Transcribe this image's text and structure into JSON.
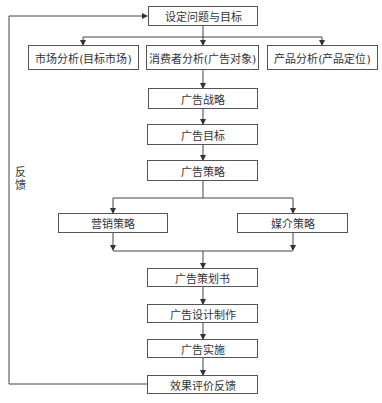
{
  "diagram": {
    "nodes": {
      "start": "设定问题与目标",
      "market": "市场分析(目标市场)",
      "consumer": "消费者分析(广告对象)",
      "product": "产品分析(产品定位)",
      "ad_strategy": "广告战略",
      "ad_goal": "广告目标",
      "ad_tactics": "广告策略",
      "marketing": "营销策略",
      "media": "媒介策略",
      "ad_plan": "广告策划书",
      "ad_design": "广告设计制作",
      "ad_impl": "广告实施",
      "eval": "效果评价反馈"
    },
    "feedback_label": "反馈"
  }
}
